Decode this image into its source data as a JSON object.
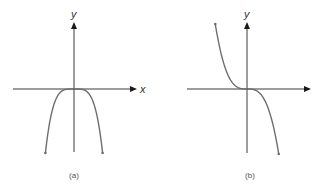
{
  "chart_data": [
    {
      "type": "line",
      "title": "",
      "caption": "(a)",
      "xlabel": "x",
      "ylabel": "y",
      "function": "y = -x^4",
      "description": "Even-degree polynomial with negative leading coefficient; flat at the origin, both ends fall toward negative infinity.",
      "x": [
        -1.3,
        -1.0,
        -0.6,
        -0.3,
        0,
        0.3,
        0.6,
        1.0,
        1.3
      ],
      "y": [
        -2.856,
        -1.0,
        -0.1296,
        -0.0081,
        0,
        -0.0081,
        -0.1296,
        -1.0,
        -2.856
      ],
      "xlim": [
        -2.2,
        2.2
      ],
      "ylim": [
        -2.9,
        2.9
      ],
      "grid": false,
      "legend": "none",
      "end_behavior": {
        "left": "down",
        "right": "down"
      }
    },
    {
      "type": "line",
      "title": "",
      "caption": "(b)",
      "xlabel": "",
      "ylabel": "y",
      "function": "y = -x^3",
      "description": "Odd-degree polynomial with negative leading coefficient; rises to the left, falls to the right, flat inflection at the origin.",
      "x": [
        -1.35,
        -1.0,
        -0.6,
        -0.3,
        0,
        0.3,
        0.6,
        1.0,
        1.35
      ],
      "y": [
        2.46,
        1.0,
        0.216,
        0.027,
        0,
        -0.027,
        -0.216,
        -1.0,
        -2.46
      ],
      "xlim": [
        -2.2,
        2.2
      ],
      "ylim": [
        -2.5,
        2.5
      ],
      "grid": false,
      "legend": "none",
      "end_behavior": {
        "left": "up",
        "right": "down"
      }
    }
  ],
  "colors": {
    "axis": "#3a3a3a",
    "curve": "#6e6e6e",
    "text": "#333333"
  }
}
